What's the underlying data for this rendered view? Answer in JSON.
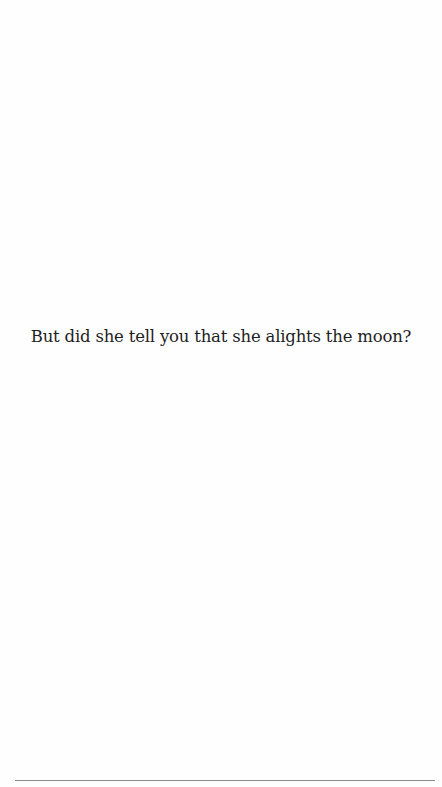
{
  "page": {
    "quote_text": "But did she tell you that she alights the moon?",
    "colors": {
      "background": "#fefefe",
      "text": "#1e1e1e",
      "rule": "#8a8a8a"
    }
  }
}
